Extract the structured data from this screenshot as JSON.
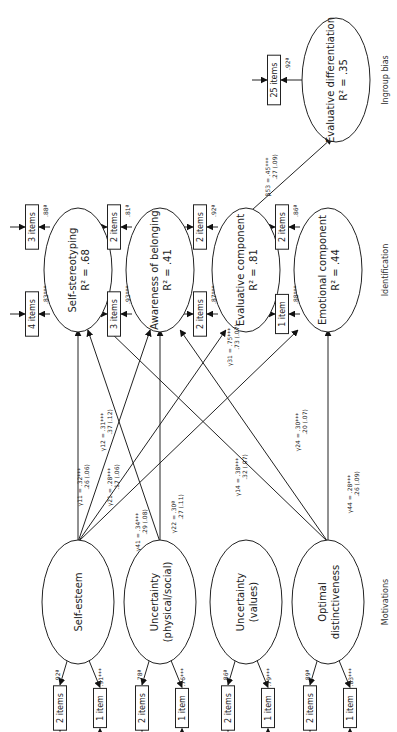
{
  "sections": {
    "motivations": "Motivations",
    "identification": "Identification",
    "ingroup_bias": "Ingroup bias"
  },
  "motivations": [
    {
      "id": "self_esteem",
      "lines": [
        "Self-esteem"
      ],
      "indicators": [
        {
          "label": "2 items",
          "loading": ".92ª"
        },
        {
          "label": "1 item",
          "loading": ".91***"
        }
      ]
    },
    {
      "id": "uncertainty_phys",
      "lines": [
        "Uncertainty",
        "(physical/social)"
      ],
      "indicators": [
        {
          "label": "2 items",
          "loading": ".78ª"
        },
        {
          "label": "1 item",
          "loading": ".76***"
        }
      ]
    },
    {
      "id": "uncertainty_values",
      "lines": [
        "Uncertainty",
        "(values)"
      ],
      "indicators": [
        {
          "label": "2 items",
          "loading": ".86ª"
        },
        {
          "label": "1 item",
          "loading": ".79***"
        }
      ]
    },
    {
      "id": "optimal",
      "lines": [
        "Optimal",
        "distinctiveness"
      ],
      "indicators": [
        {
          "label": "2 items",
          "loading": ".89ª"
        },
        {
          "label": "1 item",
          "loading": ".83***"
        }
      ]
    }
  ],
  "identification": [
    {
      "id": "self_stereo",
      "lines": [
        "Self-stereotyping",
        "R² = .68"
      ],
      "indicators": [
        {
          "label": "3 items",
          "loading": ".88ª"
        },
        {
          "label": "4 items",
          "loading": ".83***"
        }
      ]
    },
    {
      "id": "awareness",
      "lines": [
        "Awareness of belonging",
        "R² = .41"
      ],
      "indicators": [
        {
          "label": "2 items",
          "loading": ".81ª"
        },
        {
          "label": "3 items",
          "loading": ".93***"
        }
      ]
    },
    {
      "id": "evaluative",
      "lines": [
        "Evaluative component",
        "R² = .81"
      ],
      "indicators": [
        {
          "label": "2 items",
          "loading": ".92ª"
        },
        {
          "label": "2 items",
          "loading": ".87***"
        }
      ]
    },
    {
      "id": "emotional",
      "lines": [
        "Emotional component",
        "R² = .44"
      ],
      "indicators": [
        {
          "label": "2 items",
          "loading": ".86ª"
        },
        {
          "label": "1 item",
          "loading": ".88***"
        }
      ]
    }
  ],
  "ingroup_bias": {
    "id": "eval_diff",
    "lines": [
      "Evaluative differentiation",
      "R² = .35"
    ],
    "indicator": {
      "label": "25 items",
      "loading": ".92ª"
    }
  },
  "paths": [
    {
      "from": "self_esteem",
      "to": "self_stereo",
      "label": "γ11 = .32***",
      "sub": ".26 (.06)"
    },
    {
      "from": "self_esteem",
      "to": "awareness",
      "label": "γ21 = .28***",
      "sub": ".17 (.06)"
    },
    {
      "from": "self_esteem",
      "to": "evaluative",
      "label": "γ31 = .75***",
      "sub": ".73 (.07)"
    },
    {
      "from": "self_esteem",
      "to": "emotional",
      "label": "γ41 = .34***",
      "sub": ".29 (.08)"
    },
    {
      "from": "uncertainty_phys",
      "to": "self_stereo",
      "label": "γ12 = .31***",
      "sub": ".37 (.12)"
    },
    {
      "from": "uncertainty_phys",
      "to": "awareness",
      "label": "γ22 = .30ª",
      "sub": ".27 (.11)"
    },
    {
      "from": "optimal",
      "to": "self_stereo",
      "label": "γ14 = .38***",
      "sub": ".32 (.07)"
    },
    {
      "from": "optimal",
      "to": "awareness",
      "label": "γ24 = .30***",
      "sub": ".20 (.07)"
    },
    {
      "from": "optimal",
      "to": "emotional",
      "label": "γ44 = .28***",
      "sub": ".26 (.09)"
    },
    {
      "from": "evaluative",
      "to": "eval_diff",
      "label": "β53 = .45***",
      "sub": ".27 (.09)"
    }
  ]
}
